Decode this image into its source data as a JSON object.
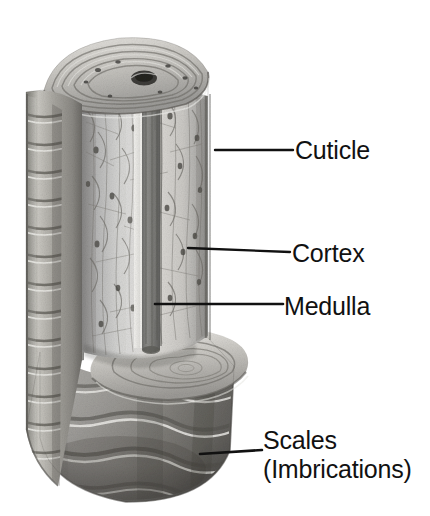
{
  "figure": {
    "background_color": "#ffffff",
    "line_color": "#111111",
    "text_color": "#111111"
  },
  "labels": [
    {
      "id": "cuticle",
      "name": "Cuticle",
      "text": "Cuticle",
      "leader_line": {
        "x1": 215,
        "y1": 150,
        "x2": 293,
        "y2": 150
      }
    },
    {
      "id": "cortex",
      "name": "Cortex",
      "text": "Cortex",
      "leader_line": {
        "x1": 188,
        "y1": 248,
        "x2": 290,
        "y2": 252
      }
    },
    {
      "id": "medulla",
      "name": "Medulla",
      "text": "Medulla",
      "leader_line": {
        "x1": 155,
        "y1": 304,
        "x2": 283,
        "y2": 304
      }
    },
    {
      "id": "scales",
      "name": "Scales (Imbrications)",
      "text": "Scales",
      "text_line2": "(Imbrications)",
      "leader_line": {
        "x1": 200,
        "y1": 454,
        "x2": 262,
        "y2": 450
      }
    }
  ],
  "illustration": {
    "name": "hair-shaft-illustration",
    "description": "Pencil-style rendering of a hair shaft cut open to reveal the medulla core, surrounding cortex, and outer cuticle of overlapping scales.",
    "parts": [
      {
        "name": "cuticle",
        "label": "Cuticle"
      },
      {
        "name": "cortex",
        "label": "Cortex"
      },
      {
        "name": "medulla",
        "label": "Medulla"
      },
      {
        "name": "scales",
        "label": "Scales (Imbrications)"
      }
    ]
  }
}
